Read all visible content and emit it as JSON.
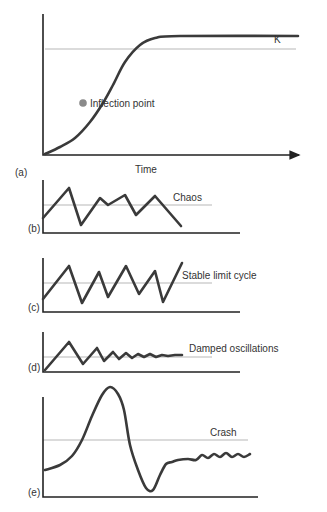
{
  "chart_data": [
    {
      "panel": "(a)",
      "type": "line",
      "title": "Logistic growth",
      "xlabel": "Time",
      "ylabel": "",
      "reference_line_label": "K",
      "annotations": [
        {
          "text": "Inflection point",
          "marker": "dot"
        }
      ],
      "points": [
        [
          45,
          154
        ],
        [
          60,
          147
        ],
        [
          75,
          138
        ],
        [
          90,
          122
        ],
        [
          103,
          103
        ],
        [
          113,
          85
        ],
        [
          125,
          62
        ],
        [
          140,
          45
        ],
        [
          155,
          38
        ],
        [
          180,
          36
        ],
        [
          298,
          36
        ]
      ],
      "inflection_point": [
        83,
        112
      ],
      "k_line_y": 36,
      "axes": {
        "x0": 43,
        "y_top": 14,
        "y_axis": 155,
        "x_end": 305
      },
      "grid": false
    },
    {
      "panel": "(b)",
      "type": "line",
      "label": "Chaos",
      "points": [
        [
          43,
          218
        ],
        [
          69,
          188
        ],
        [
          81,
          225
        ],
        [
          100,
          198
        ],
        [
          108,
          205
        ],
        [
          125,
          195
        ],
        [
          136,
          215
        ],
        [
          155,
          196
        ],
        [
          181,
          226
        ]
      ],
      "midline_y": 205,
      "axes": {
        "x0": 43,
        "y_top": 180,
        "y_axis": 233,
        "x_end": 240
      }
    },
    {
      "panel": "(c)",
      "type": "line",
      "label": "Stable limit cycle",
      "points": [
        [
          43,
          299
        ],
        [
          69,
          266
        ],
        [
          82,
          303
        ],
        [
          99,
          272
        ],
        [
          108,
          297
        ],
        [
          126,
          266
        ],
        [
          139,
          294
        ],
        [
          155,
          271
        ],
        [
          163,
          302
        ],
        [
          182,
          263
        ]
      ],
      "midline_y": 283,
      "axes": {
        "x0": 43,
        "y_top": 258,
        "y_axis": 312,
        "x_end": 240
      }
    },
    {
      "panel": "(d)",
      "type": "line",
      "label": "Damped oscillations",
      "points": [
        [
          45,
          370
        ],
        [
          69,
          342
        ],
        [
          83,
          364
        ],
        [
          97,
          348
        ],
        [
          104,
          361
        ],
        [
          113,
          352
        ],
        [
          119,
          359
        ],
        [
          126,
          353
        ],
        [
          132,
          358
        ],
        [
          138,
          354
        ],
        [
          144,
          357
        ],
        [
          150,
          354
        ],
        [
          156,
          357
        ],
        [
          162,
          355
        ],
        [
          168,
          356
        ],
        [
          175,
          355
        ],
        [
          182,
          355
        ]
      ],
      "midline_y": 357,
      "axes": {
        "x0": 43,
        "y_top": 332,
        "y_axis": 372,
        "x_end": 240
      }
    },
    {
      "panel": "(e)",
      "type": "line",
      "label": "Crash",
      "points": [
        [
          45,
          470
        ],
        [
          60,
          465
        ],
        [
          72,
          456
        ],
        [
          82,
          440
        ],
        [
          92,
          416
        ],
        [
          102,
          395
        ],
        [
          110,
          387
        ],
        [
          118,
          394
        ],
        [
          124,
          410
        ],
        [
          130,
          445
        ],
        [
          138,
          470
        ],
        [
          146,
          488
        ],
        [
          153,
          490
        ],
        [
          160,
          475
        ],
        [
          166,
          464
        ],
        [
          172,
          462
        ],
        [
          178,
          460
        ],
        [
          188,
          459
        ],
        [
          196,
          460
        ],
        [
          202,
          455
        ],
        [
          208,
          458
        ],
        [
          214,
          454
        ],
        [
          220,
          457
        ],
        [
          226,
          453
        ],
        [
          232,
          457
        ],
        [
          238,
          454
        ],
        [
          244,
          457
        ],
        [
          250,
          454
        ]
      ],
      "midline_y": 440,
      "axes": {
        "x0": 43,
        "y_top": 397,
        "y_axis": 497,
        "x_end": 258
      }
    }
  ],
  "labels": {
    "k": "K",
    "inflection": "Inflection point",
    "time": "Time",
    "a": "(a)",
    "b": "(b)",
    "c": "(c)",
    "d": "(d)",
    "e": "(e)",
    "chaos": "Chaos",
    "stable": "Stable limit cycle",
    "damped": "Damped oscillations",
    "crash": "Crash"
  },
  "colors": {
    "curve": "#3a3a3a",
    "reference": "#b8b8b8",
    "axis": "#222222",
    "inflection_dot": "#8a8a8a"
  }
}
